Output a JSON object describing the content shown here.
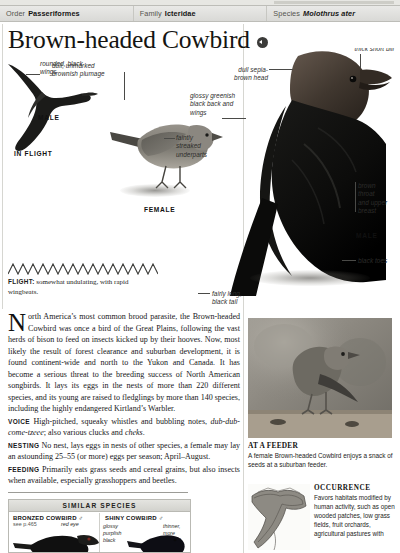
{
  "taxonomy": [
    {
      "key": "Order",
      "value": "Passeriformes",
      "italic": false
    },
    {
      "key": "Family",
      "value": "Icteridae",
      "italic": false
    },
    {
      "key": "Species",
      "value": "Molothrus ater",
      "italic": true
    }
  ],
  "title": "Brown-headed Cowbird",
  "sound_badge": "speaker-icon",
  "plate_labels": {
    "rounded_black_wings": "rounded, black\nwings",
    "male_flight": "MALE",
    "in_flight": "IN FLIGHT",
    "dull_brownish": "dull, unmarked\nbrownish plumage",
    "faintly_streaked": "faintly\nstreaked\nunderparts",
    "female": "FEMALE",
    "thick_short_bill": "thick short bill",
    "dull_sepia": "dull sepia-\nbrown head",
    "glossy_greenish": "glossy greenish\nblack back and\nwings",
    "brown_throat": "brown\nthroat\nand upper\nbreast",
    "male": "MALE",
    "black_toes": "black toes",
    "fairly_long_tail": "fairly long,\nblack tail"
  },
  "flight": {
    "label": "FLIGHT:",
    "text": " somewhat undulating, with rapid wingbeats."
  },
  "body": {
    "dropcap": "N",
    "lead": "orth America’s most common brood parasite, the Brown-headed",
    "paragraph": "Cowbird was once a bird of the Great Plains, following the vast herds of bison to feed on insects kicked up by their hooves. Now, most likely the result of forest clearance and suburban development, it is found continent-wide and north to the Yukon and Canada. It has become a serious threat to the breeding success of North American songbirds. It lays its eggs in the nests of more than 220 different species, and its young are raised to fledglings by more than 140 species, including the highly endangered Kirtland’s Warbler.",
    "sections": [
      {
        "label": "VOICE",
        "text": " High-pitched, squeaky whistles and bubbling notes, ",
        "italic_part": "dub-dub-come-tzeee",
        "text_after": "; also various clucks and ",
        "italic_part2": "cheks",
        "text_end": "."
      },
      {
        "label": "NESTING",
        "text": " No nest, lays eggs in nests of other species, a female may lay an astounding 25–55 (or more) eggs per season; April–August."
      },
      {
        "label": "FEEDING",
        "text": " Primarily eats grass seeds and cereal grains, but also insects when available, especially grasshoppers and beetles."
      }
    ]
  },
  "similar_species": {
    "heading": "SIMILAR SPECIES",
    "items": [
      {
        "name": "BRONZED COWBIRD",
        "sex": "♂",
        "page_ref": "see p.465",
        "callout": "red eye"
      },
      {
        "name": "SHINY COWBIRD",
        "sex": "♂",
        "callout": "glossy\npurplish\nblack",
        "callout2": "thinner,\nmore\npointed"
      }
    ]
  },
  "feeder_photo": {
    "title": "AT A FEEDER",
    "caption": "A female Brown-headed Cowbird enjoys a snack of seeds at a suburban feeder."
  },
  "occurrence": {
    "title": "OCCURRENCE",
    "text": "Favors habitats modified by human activity, such as open wooded patches, low grass fields, fruit orchards, agricultural pastures with"
  },
  "colors": {
    "header_bg": "#e0e0dc",
    "ink": "#17171a",
    "rule": "#b9b9b3"
  }
}
